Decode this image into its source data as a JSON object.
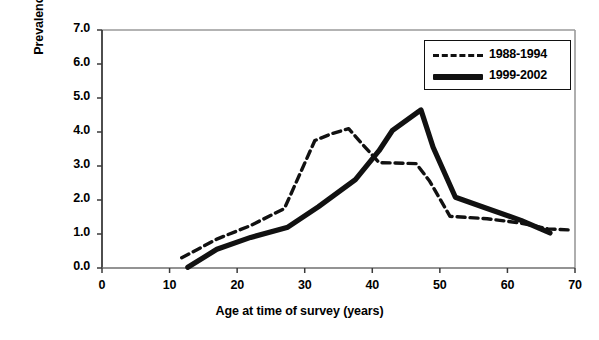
{
  "chart_data": {
    "type": "line",
    "title": "",
    "xlabel": "Age at time of survey (years)",
    "ylabel_line1": "Prevalence of anti-HCV",
    "ylabel_line2": "(%)",
    "xlim": [
      0,
      70
    ],
    "ylim": [
      0,
      7
    ],
    "xticks": [
      0,
      10,
      20,
      30,
      40,
      50,
      60,
      70
    ],
    "xtick_labels": [
      "0",
      "10",
      "20",
      "30",
      "40",
      "50",
      "60",
      "70"
    ],
    "yticks": [
      0,
      1,
      2,
      3,
      4,
      5,
      6,
      7
    ],
    "ytick_labels": [
      "0.0",
      "1.0",
      "2.0",
      "3.0",
      "4.0",
      "5.0",
      "6.0",
      "7.0"
    ],
    "grid": false,
    "legend_position": "top-right",
    "series": [
      {
        "name": "1988-1994",
        "style": "dashed",
        "color": "#111111",
        "points": [
          [
            11.8,
            0.3
          ],
          [
            17.0,
            0.85
          ],
          [
            22.0,
            1.25
          ],
          [
            27.0,
            1.75
          ],
          [
            31.5,
            3.75
          ],
          [
            34.0,
            3.95
          ],
          [
            36.5,
            4.1
          ],
          [
            38.5,
            3.65
          ],
          [
            41.0,
            3.1
          ],
          [
            46.5,
            3.07
          ],
          [
            48.5,
            2.55
          ],
          [
            51.5,
            1.52
          ],
          [
            57.0,
            1.45
          ],
          [
            62.0,
            1.32
          ],
          [
            66.0,
            1.15
          ],
          [
            69.0,
            1.12
          ]
        ]
      },
      {
        "name": "1999-2002",
        "style": "solid",
        "color": "#111111",
        "points": [
          [
            12.7,
            0.02
          ],
          [
            17.0,
            0.55
          ],
          [
            22.0,
            0.9
          ],
          [
            27.5,
            1.2
          ],
          [
            32.0,
            1.8
          ],
          [
            37.5,
            2.6
          ],
          [
            41.0,
            3.45
          ],
          [
            43.0,
            4.05
          ],
          [
            47.2,
            4.65
          ],
          [
            49.0,
            3.55
          ],
          [
            52.3,
            2.08
          ],
          [
            57.0,
            1.75
          ],
          [
            62.0,
            1.4
          ],
          [
            66.3,
            1.03
          ]
        ]
      }
    ]
  },
  "axes": {
    "frame": {
      "left": 102,
      "top": 30,
      "right": 575,
      "bottom": 268
    }
  },
  "legend": {
    "entries": [
      {
        "label": "1988-1994",
        "swatch": "dashed-line-swatch"
      },
      {
        "label": "1999-2002",
        "swatch": "solid-line-swatch"
      }
    ]
  },
  "caption": {
    "text": ""
  }
}
